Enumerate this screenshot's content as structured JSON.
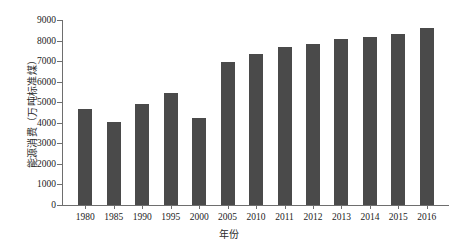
{
  "chart_data": {
    "type": "bar",
    "title": "",
    "xlabel": "年份",
    "ylabel": "能源消费（万吨标准煤）",
    "categories": [
      "1980",
      "1985",
      "1990",
      "1995",
      "2000",
      "2005",
      "2010",
      "2011",
      "2012",
      "2013",
      "2014",
      "2015",
      "2016"
    ],
    "values": [
      4650,
      4050,
      4900,
      5450,
      4250,
      6950,
      7350,
      7700,
      7850,
      8100,
      8150,
      8300,
      8600
    ],
    "ylim": [
      0,
      9000
    ],
    "yticks": [
      0,
      1000,
      2000,
      3000,
      4000,
      5000,
      6000,
      7000,
      8000,
      9000
    ],
    "ytick_labels": [
      "0",
      "1000",
      "2000",
      "3000",
      "4000",
      "5000",
      "6000",
      "7000",
      "8000",
      "9000"
    ],
    "grid": false,
    "legend": null,
    "bar_color": "#4a4a4a",
    "axis_color": "#6e6e6e",
    "background_color": "#ffffff"
  }
}
